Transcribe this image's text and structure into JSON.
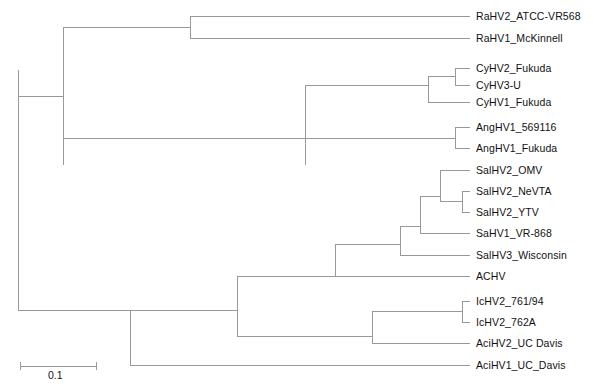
{
  "figure": {
    "type": "phylogenetic-tree",
    "style": "rectangular-cladogram",
    "background_color": "#ffffff",
    "line_color": "#999999",
    "text_color": "#111111",
    "width": 597,
    "height": 390
  },
  "scale_bar": {
    "label": "0.1",
    "value": 0.1,
    "x_start": 20,
    "x_end": 96,
    "y": 366,
    "pixels_per_unit": 760
  },
  "chart_data": {
    "type": "tree",
    "title": "",
    "xlabel": "",
    "ylabel": "",
    "leaf_count": 18,
    "leaves": [
      {
        "id": "RaHV2_ATCC-VR568",
        "label": "RaHV2_ATCC-VR568",
        "y": 16,
        "branch_x_start": 190,
        "branch_x_end": 470
      },
      {
        "id": "RaHV1_McKinnell",
        "label": "RaHV1_McKinnell",
        "y": 38,
        "branch_x_start": 190,
        "branch_x_end": 470
      },
      {
        "id": "CyHV2_Fukuda",
        "label": "CyHV2_Fukuda",
        "y": 68,
        "branch_x_start": 455,
        "branch_x_end": 470
      },
      {
        "id": "CyHV3-U",
        "label": "CyHV3-U",
        "y": 85,
        "branch_x_start": 455,
        "branch_x_end": 470
      },
      {
        "id": "CyHV1_Fukuda",
        "label": "CyHV1_Fukuda",
        "y": 102,
        "branch_x_start": 428,
        "branch_x_end": 470
      },
      {
        "id": "AngHV1_569116",
        "label": "AngHV1_569116",
        "y": 127,
        "branch_x_start": 455,
        "branch_x_end": 470
      },
      {
        "id": "AngHV1_Fukuda",
        "label": "AngHV1_Fukuda",
        "y": 148,
        "branch_x_start": 455,
        "branch_x_end": 470
      },
      {
        "id": "SalHV2_OMV",
        "label": "SalHV2_OMV",
        "y": 170,
        "branch_x_start": 440,
        "branch_x_end": 470
      },
      {
        "id": "SalHV2_NeVTA",
        "label": "SalHV2_NeVTA",
        "y": 191,
        "branch_x_start": 462,
        "branch_x_end": 470
      },
      {
        "id": "SalHV2_YTV",
        "label": "SalHV2_YTV",
        "y": 212,
        "branch_x_start": 462,
        "branch_x_end": 470
      },
      {
        "id": "SaHV1_VR-868",
        "label": "SaHV1_VR-868",
        "y": 233,
        "branch_x_start": 420,
        "branch_x_end": 470
      },
      {
        "id": "SalHV3_Wisconsin",
        "label": "SalHV3_Wisconsin",
        "y": 255,
        "branch_x_start": 400,
        "branch_x_end": 470
      },
      {
        "id": "ACHV",
        "label": "ACHV",
        "y": 276,
        "branch_x_start": 335,
        "branch_x_end": 470
      },
      {
        "id": "IcHV2_761/94",
        "label": "IcHV2_761/94",
        "y": 301,
        "branch_x_start": 462,
        "branch_x_end": 470
      },
      {
        "id": "IcHV2_762A",
        "label": "IcHV2_762A",
        "y": 322,
        "branch_x_start": 462,
        "branch_x_end": 470
      },
      {
        "id": "AciHV2_UC Davis",
        "label": "AciHV2_UC Davis",
        "y": 343,
        "branch_x_start": 372,
        "branch_x_end": 470
      },
      {
        "id": "AciHV1_UC_Davis",
        "label": "AciHV1_UC_Davis",
        "y": 365,
        "branch_x_start": 130,
        "branch_x_end": 470
      }
    ],
    "internal_nodes": [
      {
        "id": "root",
        "x": 18,
        "y_top": 70,
        "y_bottom": 310,
        "parent_x": 18
      },
      {
        "id": "upper-clade",
        "x": 63,
        "y_top": 27,
        "y_bottom": 165,
        "parent_x": 18
      },
      {
        "id": "rahv-clade",
        "x": 190,
        "y_top": 16,
        "y_bottom": 38,
        "parent_x": 63
      },
      {
        "id": "cyhv-anghv-clade",
        "x": 305,
        "y_top": 85,
        "y_bottom": 165,
        "parent_x": 63
      },
      {
        "id": "cyhv-clade",
        "x": 428,
        "y_top": 76,
        "y_bottom": 102,
        "parent_x": 305
      },
      {
        "id": "cyhv23-clade",
        "x": 455,
        "y_top": 68,
        "y_bottom": 85,
        "parent_x": 428
      },
      {
        "id": "anghv-clade",
        "x": 455,
        "y_top": 127,
        "y_bottom": 148,
        "parent_x": 305
      },
      {
        "id": "lower-clade",
        "x": 130,
        "y_top": 310,
        "y_bottom": 365,
        "parent_x": 18
      },
      {
        "id": "salmonid-ictalurid-clade",
        "x": 237,
        "y_top": 276,
        "y_bottom": 336,
        "parent_x": 130
      },
      {
        "id": "salmonid-clade",
        "x": 335,
        "y_top": 244,
        "y_bottom": 276,
        "parent_x": 237
      },
      {
        "id": "salhv-clade",
        "x": 400,
        "y_top": 226,
        "y_bottom": 255,
        "parent_x": 335
      },
      {
        "id": "salhv2-sahv1-clade",
        "x": 420,
        "y_top": 196,
        "y_bottom": 233,
        "parent_x": 400
      },
      {
        "id": "salhv2-clade",
        "x": 440,
        "y_top": 170,
        "y_bottom": 201,
        "parent_x": 420
      },
      {
        "id": "salhv2-nevta-ytv-clade",
        "x": 462,
        "y_top": 191,
        "y_bottom": 212,
        "parent_x": 440
      },
      {
        "id": "ictalurid-acipenserid-clade",
        "x": 372,
        "y_top": 311,
        "y_bottom": 343,
        "parent_x": 237
      },
      {
        "id": "ichv2-clade",
        "x": 462,
        "y_top": 301,
        "y_bottom": 322,
        "parent_x": 372
      }
    ]
  }
}
